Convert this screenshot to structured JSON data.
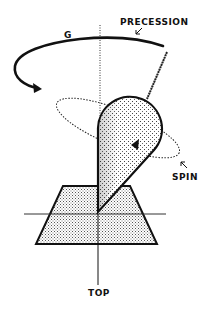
{
  "diagram": {
    "labels": {
      "precession": "PRECESSION",
      "gravity": "G",
      "spin": "SPIN",
      "top": "TOP"
    },
    "colors": {
      "line": "#111111",
      "stipple": "#9a9a9a",
      "background": "#ffffff"
    },
    "icons": {
      "precession_arrow": "curved-arrow",
      "spin_arrow": "triangle-arrowhead"
    }
  }
}
